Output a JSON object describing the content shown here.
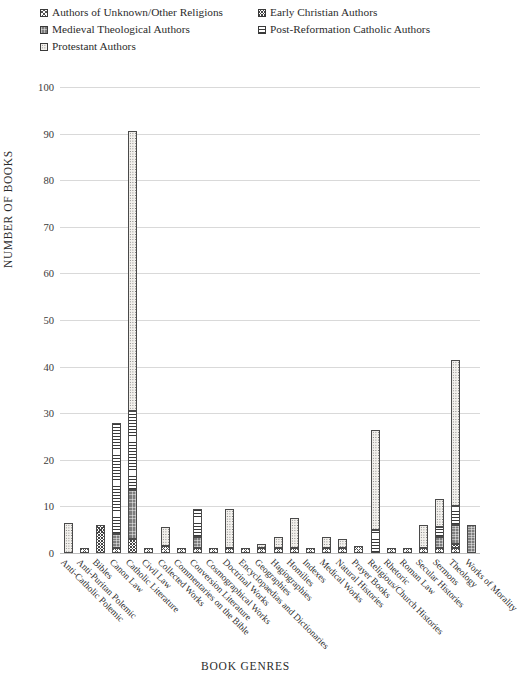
{
  "legend": {
    "rows": [
      [
        {
          "label": "Authors of Unknown/Other Religions",
          "pattern": "unknown"
        },
        {
          "label": "Early Christian Authors",
          "pattern": "early"
        }
      ],
      [
        {
          "label": "Medieval Theological Authors",
          "pattern": "medieval"
        },
        {
          "label": "Post-Reformation Catholic Authors",
          "pattern": "postref"
        }
      ],
      [
        {
          "label": "Protestant Authors",
          "pattern": "protestant"
        }
      ]
    ]
  },
  "chart_data": {
    "type": "bar",
    "title": "",
    "xlabel": "BOOK GENRES",
    "ylabel": "NUMBER OF BOOKS",
    "ylim": [
      0,
      100
    ],
    "yticks": [
      0,
      10,
      20,
      30,
      40,
      50,
      60,
      70,
      80,
      90,
      100
    ],
    "grid": true,
    "stacked": true,
    "legend_position": "top",
    "categories": [
      "Anti-Catholic Polemic",
      "Anti-Puritan Polemic",
      "Bibles",
      "Canon Law",
      "Catholic Literature",
      "Civil Law",
      "Collected Works",
      "Commentaries on the Bible",
      "Conversion Literature",
      "Cosmographical Works",
      "Doctrinal Works",
      "Encyclopaedias and Dictionaries",
      "Geographies",
      "Hagiographies",
      "Homilies",
      "Indexes",
      "Medical Works",
      "Natural Histories",
      "Prayer Books",
      "Religious/Church Histories",
      "Rhetoric",
      "Roman Law",
      "Secular Histories",
      "Sermons",
      "Theology",
      "Works of Morality"
    ],
    "series": [
      {
        "name": "Authors of Unknown/Other Religions",
        "pattern": "unknown",
        "values": [
          0,
          1,
          0,
          1,
          0,
          1,
          1.5,
          1,
          1,
          1,
          1,
          1,
          1,
          1,
          1,
          1,
          1,
          1,
          1.5,
          0,
          1,
          1,
          1,
          1,
          1,
          0
        ]
      },
      {
        "name": "Early Christian Authors",
        "pattern": "early",
        "values": [
          0,
          0,
          6,
          0,
          3,
          0,
          0,
          0,
          0,
          0,
          0,
          0,
          0,
          0,
          0,
          0,
          0,
          0,
          0,
          0,
          0,
          0,
          0,
          0,
          1,
          0
        ]
      },
      {
        "name": "Medieval Theological Authors",
        "pattern": "medieval",
        "values": [
          0,
          0,
          0,
          3,
          10.5,
          0,
          0,
          0,
          2.5,
          0,
          0,
          0,
          0,
          0,
          0,
          0,
          0,
          0,
          0,
          0,
          0,
          0,
          0,
          2.5,
          4,
          6
        ]
      },
      {
        "name": "Post-Reformation Catholic Authors",
        "pattern": "postref",
        "values": [
          0,
          0,
          0,
          24,
          17,
          0,
          0,
          0,
          6,
          0,
          0,
          0,
          0,
          0,
          0,
          0,
          0,
          0,
          0,
          5,
          0,
          0,
          0,
          2,
          4,
          0
        ]
      },
      {
        "name": "Protestant Authors",
        "pattern": "protestant",
        "values": [
          6.5,
          0,
          0,
          0,
          60,
          0,
          4,
          0,
          0,
          0,
          8.5,
          0,
          1,
          2.5,
          6.5,
          0,
          2.5,
          2,
          0,
          21.5,
          0,
          0,
          5,
          6,
          31.5,
          0
        ]
      }
    ],
    "totals": [
      6.5,
      1,
      6,
      28,
      91,
      1,
      5.5,
      1,
      9.5,
      1,
      9.5,
      1,
      2,
      3.5,
      7.5,
      1,
      3.5,
      3,
      1.5,
      26.5,
      1,
      1,
      6,
      11.5,
      41.5,
      6
    ]
  }
}
